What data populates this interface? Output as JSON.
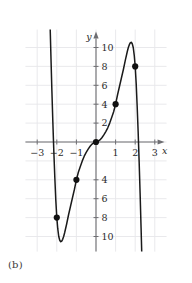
{
  "figure": {
    "caption": "(b)",
    "background_color": "#ffffff",
    "grid_color": "#e6e6ea",
    "axis_color": "#6e6e72",
    "curve_color": "#1a1a1a",
    "point_color": "#111111"
  },
  "chart_data": {
    "type": "line",
    "title": "",
    "subtitle": "",
    "xlabel": "x",
    "ylabel": "y",
    "xlim": [
      -3.6,
      3.6
    ],
    "ylim": [
      -11.6,
      11.9
    ],
    "grid": true,
    "legend": null,
    "x_ticks": [
      -3,
      -2,
      -1,
      1,
      2,
      3
    ],
    "x_tick_labels": [
      "−3",
      "−2",
      "−1",
      "1",
      "2",
      "3"
    ],
    "y_ticks": [
      10,
      8,
      6,
      4,
      2,
      -4,
      -6,
      -8,
      -10
    ],
    "y_tick_labels": [
      "10",
      "8",
      "6",
      "4",
      "2",
      "4",
      "6",
      "8",
      "10"
    ],
    "grid_x": [
      -3,
      -2,
      -1,
      0,
      1,
      2,
      3
    ],
    "grid_y": [
      -10,
      -8,
      -6,
      -4,
      -2,
      0,
      2,
      4,
      6,
      8,
      10
    ],
    "series": [
      {
        "name": "curve",
        "type": "line",
        "x": [
          -2.34,
          -2.3,
          -2.25,
          -2.2,
          -2.15,
          -2.1,
          -2.05,
          -2.0,
          -1.95,
          -1.9,
          -1.85,
          -1.8,
          -1.75,
          -1.7,
          -1.65,
          -1.6,
          -1.5,
          -1.4,
          -1.3,
          -1.2,
          -1.1,
          -1.0,
          -0.9,
          -0.8,
          -0.7,
          -0.6,
          -0.5,
          -0.4,
          -0.3,
          -0.2,
          -0.1,
          0.0,
          0.1,
          0.2,
          0.3,
          0.4,
          0.5,
          0.6,
          0.7,
          0.8,
          0.9,
          1.0,
          1.1,
          1.2,
          1.3,
          1.4,
          1.5,
          1.6,
          1.65,
          1.7,
          1.75,
          1.8,
          1.85,
          1.9,
          1.95,
          2.0,
          2.05,
          2.1,
          2.15,
          2.2,
          2.25,
          2.3,
          2.34
        ],
        "y": [
          12.2,
          9.1,
          5.4,
          2.0,
          -1.1,
          -3.8,
          -6.2,
          -8.0,
          -9.2,
          -10.0,
          -10.4,
          -10.55,
          -10.5,
          -10.3,
          -10.0,
          -9.6,
          -8.7,
          -7.7,
          -6.8,
          -5.9,
          -5.0,
          -4.0,
          -3.2,
          -2.6,
          -2.0,
          -1.5,
          -1.1,
          -0.75,
          -0.45,
          -0.22,
          -0.07,
          0.0,
          0.07,
          0.22,
          0.45,
          0.75,
          1.1,
          1.5,
          2.0,
          2.6,
          3.2,
          4.0,
          5.0,
          5.9,
          6.8,
          7.7,
          8.7,
          9.6,
          10.0,
          10.3,
          10.5,
          10.55,
          10.4,
          10.0,
          9.2,
          8.0,
          6.2,
          3.8,
          1.1,
          -2.0,
          -5.4,
          -9.1,
          -12.2
        ]
      }
    ],
    "points": [
      {
        "x": -2,
        "y": -8,
        "label": ""
      },
      {
        "x": -1,
        "y": -4,
        "label": ""
      },
      {
        "x": 0,
        "y": 0,
        "label": ""
      },
      {
        "x": 1,
        "y": 4,
        "label": ""
      },
      {
        "x": 2,
        "y": 8,
        "label": ""
      }
    ],
    "annotations": {
      "x_axis_arrow": true,
      "y_axis_arrow": true,
      "local_minimum": {
        "x": -1.78,
        "y": -10.55
      },
      "local_maximum": {
        "x": 1.78,
        "y": 10.55
      }
    }
  }
}
